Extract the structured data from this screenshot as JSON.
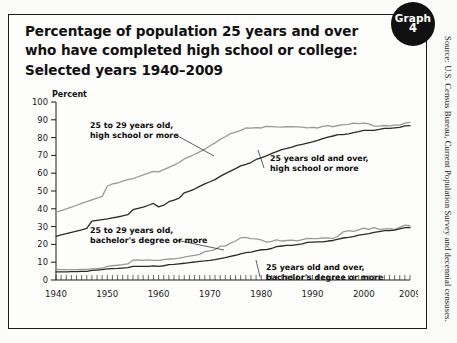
{
  "badge": {
    "line1": "Graph",
    "line2": "4"
  },
  "title": {
    "line1": "Percentage of population 25 years and over",
    "line2": "who have completed high school or college:",
    "line3": "Selected years 1940–2009"
  },
  "source": "Source: U.S. Census Bureau, Current Population Survey and decennial censuses.",
  "colors": {
    "ink": "#111111",
    "series_dark": "#2a2a2a",
    "series_gray": "#9a9a9a",
    "frame": "#1b1b1b",
    "badge_bg": "#111111",
    "badge_fg": "#ffffff"
  },
  "chart_data": {
    "type": "line",
    "xlabel": "",
    "ylabel": "Percent",
    "xlim": [
      1940,
      2009
    ],
    "ylim": [
      0,
      100
    ],
    "yticks": [
      0,
      10,
      20,
      30,
      40,
      50,
      60,
      70,
      80,
      90,
      100
    ],
    "xticks": [
      1940,
      1950,
      1960,
      1970,
      1980,
      1990,
      2000,
      2009
    ],
    "xtick_labels": [
      "1940",
      "1950",
      "1960",
      "1970",
      "1980",
      "1990",
      "2000",
      "2009"
    ],
    "minor_xtick_step": 1,
    "grid": false,
    "legend": "inline-annotations",
    "x": [
      1940,
      1941,
      1942,
      1943,
      1944,
      1945,
      1946,
      1947,
      1948,
      1949,
      1950,
      1951,
      1952,
      1953,
      1954,
      1955,
      1956,
      1957,
      1958,
      1959,
      1960,
      1961,
      1962,
      1963,
      1964,
      1965,
      1966,
      1967,
      1968,
      1969,
      1970,
      1971,
      1972,
      1973,
      1974,
      1975,
      1976,
      1977,
      1978,
      1979,
      1980,
      1981,
      1982,
      1983,
      1984,
      1985,
      1986,
      1987,
      1988,
      1989,
      1990,
      1991,
      1992,
      1993,
      1994,
      1995,
      1996,
      1997,
      1998,
      1999,
      2000,
      2001,
      2002,
      2003,
      2004,
      2005,
      2006,
      2007,
      2008,
      2009
    ],
    "series": [
      {
        "name": "25 to 29 years old, high school or more",
        "color": "#9a9a9a",
        "label_lines": [
          "25 to 29 years old,",
          "high school or more"
        ],
        "values": [
          38.1,
          39.0,
          40.0,
          41.0,
          42.0,
          43.0,
          44.0,
          45.0,
          46.0,
          47.0,
          52.8,
          54.0,
          54.5,
          55.5,
          56.4,
          57.0,
          58.0,
          59.0,
          60.0,
          61.0,
          60.7,
          62.0,
          63.3,
          64.5,
          66.0,
          68.0,
          69.3,
          70.5,
          72.0,
          73.5,
          75.4,
          77.0,
          79.0,
          80.5,
          82.2,
          83.1,
          84.1,
          85.4,
          85.3,
          85.6,
          85.4,
          86.3,
          86.2,
          86.0,
          85.9,
          86.1,
          86.1,
          86.0,
          85.9,
          85.5,
          85.7,
          85.4,
          86.3,
          86.7,
          86.1,
          86.8,
          87.3,
          87.4,
          88.1,
          87.8,
          88.1,
          87.7,
          86.4,
          86.5,
          86.8,
          86.6,
          87.0,
          87.0,
          88.1,
          88.6
        ]
      },
      {
        "name": "25 years old and over, high school or more",
        "color": "#2a2a2a",
        "label_lines": [
          "25 years old and over,",
          "high school or more"
        ],
        "values": [
          24.5,
          25.3,
          26.0,
          26.8,
          27.5,
          28.2,
          29.0,
          33.1,
          33.5,
          33.9,
          34.3,
          34.9,
          35.4,
          36.0,
          36.7,
          39.5,
          40.3,
          41.0,
          42.0,
          43.0,
          41.1,
          42.0,
          44.0,
          44.9,
          46.0,
          49.0,
          49.9,
          51.1,
          52.6,
          54.0,
          55.2,
          56.4,
          58.2,
          59.8,
          61.2,
          62.6,
          64.1,
          65.0,
          66.0,
          67.7,
          68.6,
          69.7,
          71.0,
          72.1,
          73.3,
          73.9,
          74.7,
          75.6,
          76.2,
          76.9,
          77.6,
          78.4,
          79.4,
          80.2,
          80.9,
          81.7,
          81.7,
          82.1,
          82.8,
          83.4,
          84.1,
          84.1,
          84.1,
          84.6,
          85.2,
          85.2,
          85.5,
          85.7,
          86.6,
          86.7
        ]
      },
      {
        "name": "25 to 29 years old, bachelor's degree or more",
        "color": "#9a9a9a",
        "label_lines": [
          "25 to 29 years old,",
          "bachelor's degree or more"
        ],
        "values": [
          5.9,
          5.8,
          5.8,
          5.8,
          5.8,
          5.9,
          6.0,
          6.2,
          6.4,
          6.6,
          7.7,
          8.0,
          8.3,
          8.6,
          9.0,
          11.1,
          11.3,
          11.0,
          11.3,
          11.0,
          11.0,
          11.4,
          11.8,
          11.9,
          12.3,
          12.8,
          13.4,
          13.8,
          14.4,
          15.9,
          16.4,
          17.1,
          19.0,
          19.0,
          20.7,
          21.9,
          23.7,
          24.0,
          23.3,
          23.1,
          22.5,
          21.3,
          21.7,
          22.5,
          21.9,
          22.2,
          22.4,
          22.0,
          22.7,
          23.4,
          23.2,
          23.2,
          23.6,
          23.7,
          23.3,
          24.7,
          27.1,
          27.8,
          27.3,
          28.2,
          29.1,
          28.4,
          29.4,
          28.4,
          28.7,
          28.8,
          28.4,
          29.6,
          30.8,
          30.6
        ]
      },
      {
        "name": "25 years old and over, bachelor's degree or more",
        "color": "#2a2a2a",
        "label_lines": [
          "25 years old and over,",
          "bachelor's degree or more"
        ],
        "values": [
          4.6,
          4.6,
          4.6,
          4.7,
          4.7,
          4.8,
          4.9,
          5.4,
          5.6,
          5.8,
          6.2,
          6.4,
          6.5,
          6.7,
          6.9,
          7.6,
          7.7,
          7.6,
          7.7,
          7.9,
          7.7,
          8.0,
          8.6,
          8.8,
          9.1,
          9.4,
          9.8,
          10.1,
          10.5,
          10.7,
          11.0,
          11.4,
          12.0,
          12.6,
          13.3,
          13.9,
          14.7,
          15.4,
          15.7,
          16.4,
          17.0,
          17.1,
          17.7,
          18.8,
          19.1,
          19.4,
          19.4,
          19.9,
          20.3,
          21.1,
          21.3,
          21.4,
          21.4,
          21.9,
          22.2,
          23.0,
          23.6,
          23.9,
          24.4,
          25.2,
          25.6,
          26.1,
          26.7,
          27.2,
          27.7,
          27.7,
          28.0,
          28.7,
          29.4,
          29.5
        ]
      }
    ],
    "annotations": [
      {
        "id": "ann-25to29-hs",
        "text_lines": [
          "25 to 29 years old,",
          "high school or more"
        ],
        "x_px": 72,
        "y_px": 40,
        "leader_to_x_px": 196,
        "leader_to_y_px": 68
      },
      {
        "id": "ann-25over-hs",
        "text_lines": [
          "25 years old and over,",
          "high school or more"
        ],
        "x_px": 252,
        "y_px": 73,
        "leader_to_x_px": 240,
        "leader_to_y_px": 62
      },
      {
        "id": "ann-25to29-ba",
        "text_lines": [
          "25 to 29 years old,",
          "bachelor's degree or more"
        ],
        "x_px": 72,
        "y_px": 145,
        "leader_to_x_px": 206,
        "leader_to_y_px": 162
      },
      {
        "id": "ann-25over-ba",
        "text_lines": [
          "25 years old and over,",
          "bachelor's degree or more"
        ],
        "x_px": 248,
        "y_px": 182,
        "leader_to_x_px": 238,
        "leader_to_y_px": 172
      }
    ]
  }
}
